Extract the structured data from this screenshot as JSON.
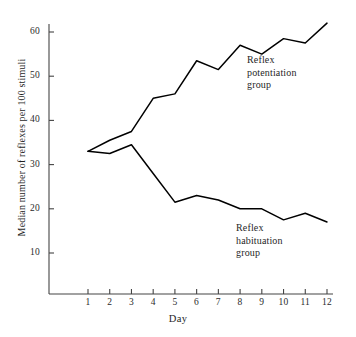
{
  "chart_data": {
    "type": "line",
    "title": "",
    "xlabel": "Day",
    "ylabel": "Median number of reflexes per 100 stimuli",
    "x": [
      1,
      2,
      3,
      4,
      5,
      6,
      7,
      8,
      9,
      10,
      11,
      12
    ],
    "xtick_labels": [
      "1",
      "2",
      "3",
      "4",
      "5",
      "6",
      "7",
      "8",
      "9",
      "10",
      "11",
      "12"
    ],
    "ytick_labels": [
      "10",
      "20",
      "30",
      "40",
      "50",
      "60"
    ],
    "yticks": [
      10,
      20,
      30,
      40,
      50,
      60
    ],
    "xlim": [
      0.45,
      12.45
    ],
    "ylim": [
      0,
      65
    ],
    "grid": false,
    "legend_position": "inline-annotation",
    "series": [
      {
        "name": "Reflex potentiation group",
        "color": "#000000",
        "values": [
          33,
          35.5,
          37.5,
          45,
          46,
          53.5,
          51.5,
          57,
          55,
          58.5,
          57.5,
          62
        ]
      },
      {
        "name": "Reflex habituation group",
        "color": "#000000",
        "values": [
          33,
          32.5,
          34.5,
          28,
          21.5,
          23,
          22,
          20,
          20,
          17.5,
          19,
          17
        ]
      }
    ],
    "annotations": [
      {
        "id": "potentiation",
        "lines": [
          "Reflex",
          "potentiation",
          "group"
        ]
      },
      {
        "id": "habituation",
        "lines": [
          "Reflex",
          "habituation",
          "group"
        ]
      }
    ]
  },
  "axis": {
    "x_title": "Day",
    "y_title": "Median number of reflexes per 100 stimuli"
  }
}
